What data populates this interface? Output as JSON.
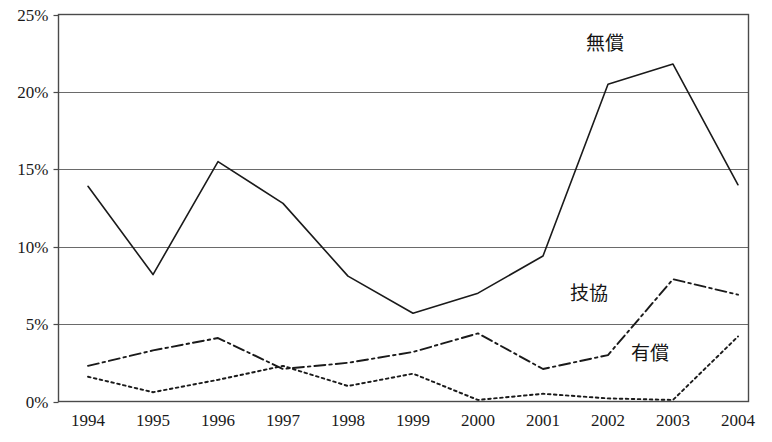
{
  "chart_data": {
    "type": "line",
    "title": "",
    "subtitle": "",
    "xlabel": "",
    "ylabel": "",
    "categories": [
      "1994",
      "1995",
      "1996",
      "1997",
      "1998",
      "1999",
      "2000",
      "2001",
      "2002",
      "2003",
      "2004"
    ],
    "x": [
      1994,
      1995,
      1996,
      1997,
      1998,
      1999,
      2000,
      2001,
      2002,
      2003,
      2004
    ],
    "ylim": [
      0,
      25
    ],
    "yticks": [
      0,
      5,
      10,
      15,
      20,
      25
    ],
    "ytick_labels": [
      "0%",
      "5%",
      "10%",
      "15%",
      "20%",
      "25%"
    ],
    "grid": "horizontal",
    "legend_position": "inline-annotations",
    "series": [
      {
        "name": "無償",
        "label": "無償",
        "style": "solid",
        "color": "#1a1a1a",
        "values": [
          13.9,
          8.2,
          15.5,
          12.8,
          8.1,
          5.7,
          7.0,
          9.4,
          20.5,
          21.8,
          14.0
        ]
      },
      {
        "name": "技協",
        "label": "技協",
        "style": "dash-dot",
        "color": "#1a1a1a",
        "values": [
          2.3,
          3.3,
          4.1,
          2.1,
          2.5,
          3.2,
          4.4,
          2.1,
          3.0,
          7.9,
          6.9
        ]
      },
      {
        "name": "有償",
        "label": "有償",
        "style": "dotted",
        "color": "#1a1a1a",
        "values": [
          1.6,
          0.6,
          1.4,
          2.3,
          1.0,
          1.8,
          0.1,
          0.5,
          0.2,
          0.1,
          4.2
        ]
      }
    ],
    "annotations": [
      {
        "text": "無償",
        "series": "無償",
        "x_px": 605,
        "y_px": 50
      },
      {
        "text": "技協",
        "series": "技協",
        "x_px": 589,
        "y_px": 300
      },
      {
        "text": "有償",
        "series": "有償",
        "x_px": 650,
        "y_px": 360
      }
    ]
  },
  "axis": {
    "y_tick_labels": [
      "25%",
      "20%",
      "15%",
      "10%",
      "5%",
      "0%"
    ],
    "x_tick_labels": [
      "1994",
      "1995",
      "1996",
      "1997",
      "1998",
      "1999",
      "2000",
      "2001",
      "2002",
      "2003",
      "2004"
    ]
  },
  "colors": {
    "line": "#1a1a1a",
    "grid": "#6a6a6a",
    "frame": "#4a4a4a",
    "background": "#ffffff",
    "text": "#1a1a1a"
  }
}
